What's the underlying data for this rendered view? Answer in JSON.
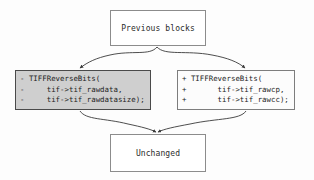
{
  "diagram": {
    "background_color": "#fdfdfd",
    "nodes": {
      "previous": {
        "label": "Previous blocks",
        "fill": "#ffffff",
        "border": "#8c8c8c"
      },
      "unchanged": {
        "label": "Unchanged",
        "fill": "#ffffff",
        "border": "#8c8c8c"
      },
      "removed": {
        "fill": "#cfcfcf",
        "border": "#4a4a4a",
        "lines": [
          "- TIFFReverseBits(",
          "-     tif->tif_rawdata,",
          "-     tif->tif_rawdatasize);"
        ]
      },
      "added": {
        "fill": "#fcfcfc",
        "border": "#7d7d7d",
        "lines": [
          "+ TIFFReverseBits(",
          "+       tif->tif_rawcp,",
          "+       tif->tif_rawcc);"
        ]
      }
    },
    "edges": {
      "stroke": "#3a3a3a",
      "connections": [
        "previous-to-removed",
        "previous-to-added",
        "removed-to-unchanged",
        "added-to-unchanged"
      ]
    }
  }
}
